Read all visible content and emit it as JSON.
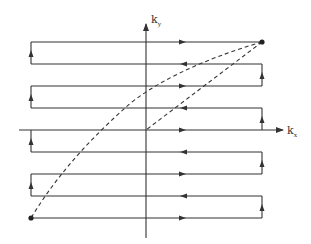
{
  "diagram": {
    "axes": {
      "ky_label": "k",
      "ky_sub": "y",
      "kx_label": "k",
      "kx_sub": "x"
    },
    "geometry": {
      "x_left": 31,
      "x_right": 262,
      "origin_x": 146,
      "origin_y": 130,
      "row_ys": [
        42,
        64,
        86,
        108,
        130,
        152,
        174,
        196,
        218
      ],
      "row_directions": [
        "right",
        "left",
        "right",
        "left",
        "right",
        "left",
        "right",
        "left",
        "right"
      ],
      "arrow_x": 183
    },
    "points": {
      "start_dot": {
        "x": 31,
        "y": 218
      },
      "end_dot": {
        "x": 262,
        "y": 42
      }
    },
    "dashed_paths": [
      {
        "name": "curved-dashed-path",
        "from": [
          262,
          42
        ],
        "to": [
          31,
          218
        ]
      },
      {
        "name": "straight-dashed-path",
        "from": [
          262,
          42
        ],
        "to": [
          146,
          130
        ]
      }
    ],
    "colors": {
      "line": "#333333",
      "background": "#ffffff"
    }
  }
}
